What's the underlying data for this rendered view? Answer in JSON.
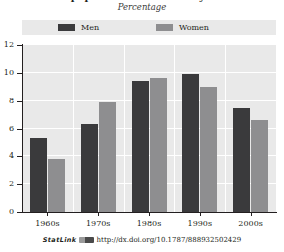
{
  "header": {
    "title": "Share of population with tertiary education",
    "subtitle": "Percentage"
  },
  "legend": {
    "position": "top",
    "entries": [
      {
        "label": "Men",
        "color": "#3a3a3c",
        "icon": "legend-swatch-icon"
      },
      {
        "label": "Women",
        "color": "#8e8e90",
        "icon": "legend-swatch-icon"
      }
    ]
  },
  "axes": {
    "y_ticks": [
      "0",
      "2",
      "4",
      "6",
      "8",
      "10",
      "12"
    ],
    "x_ticks": [
      "1960s",
      "1970s",
      "1980s",
      "1990s",
      "2000s"
    ]
  },
  "footer": {
    "statlink_label": "StatLink",
    "badge": "statlink-badge-icon",
    "url": "http://dx.doi.org/10.1787/888932502429"
  },
  "chart_data": {
    "type": "bar",
    "title": "Share of population with tertiary education",
    "subtitle": "Percentage",
    "xlabel": "",
    "ylabel": "Percentage",
    "ylim": [
      0,
      12
    ],
    "ytick_step": 2,
    "grid": true,
    "legend_position": "top",
    "categories": [
      "1960s",
      "1970s",
      "1980s",
      "1990s",
      "2000s"
    ],
    "series": [
      {
        "name": "Men",
        "color": "#3a3a3c",
        "values": [
          5.3,
          6.3,
          9.4,
          9.9,
          7.5
        ]
      },
      {
        "name": "Women",
        "color": "#8e8e90",
        "values": [
          3.8,
          7.9,
          9.6,
          9.0,
          6.6
        ]
      }
    ]
  }
}
